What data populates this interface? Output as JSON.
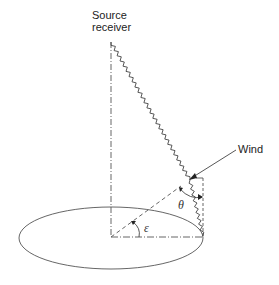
{
  "labels": {
    "source_line1": "Source",
    "source_line2": "receiver",
    "wind": "Wind",
    "theta": "θ",
    "epsilon": "ε"
  },
  "geometry": {
    "center": [
      111,
      237
    ],
    "source": [
      111,
      42
    ],
    "ellipse": {
      "cx": 111,
      "cy": 238,
      "rx": 92,
      "ry": 31
    },
    "bend_point": [
      190,
      180
    ],
    "ground_point": [
      203,
      236
    ],
    "wind_from": [
      236,
      150
    ],
    "wind_to": [
      190,
      179
    ],
    "right_vertical_top": [
      203,
      178
    ],
    "dashed_end": [
      180,
      186
    ]
  },
  "colors": {
    "line": "#444444",
    "text": "#222222",
    "background": "#ffffff"
  }
}
